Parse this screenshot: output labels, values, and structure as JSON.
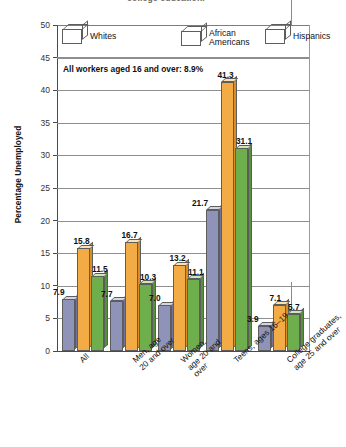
{
  "title": "college education.",
  "annotation": "All workers aged 16 and over: 8.9%",
  "y_axis_title": "Percentage Unemployed",
  "legend": [
    {
      "label": "Whites",
      "color": "#8f93b8",
      "key": "whites"
    },
    {
      "label": "African\nAmericans",
      "color": "#f2ab45",
      "key": "african-americans"
    },
    {
      "label": "Hispanics",
      "color": "#6fae4c",
      "key": "hispanics"
    }
  ],
  "y_ticks": [
    "0",
    "5",
    "10",
    "15",
    "20",
    "25",
    "30",
    "35",
    "40",
    "45",
    "50"
  ],
  "categories": [
    "All",
    "Men, age\n20 and over",
    "Women,\nage 20 and\nover",
    "Teens, ages 16–19",
    "College graduates,\nage 25 and over"
  ],
  "chart_data": {
    "type": "bar",
    "title": "college education.",
    "xlabel": "",
    "ylabel": "Percentage Unemployed",
    "ylim": [
      0,
      50
    ],
    "ytick_step": 5,
    "grid": true,
    "legend_position": "top-inside",
    "annotation": "All workers aged 16 and over: 8.9%",
    "categories": [
      "All",
      "Men, age 20 and over",
      "Women, age 20 and over",
      "Teens, ages 16–19",
      "College graduates, age 25 and over"
    ],
    "series": [
      {
        "name": "Whites",
        "color": "#8f93b8",
        "values": [
          7.9,
          7.7,
          7.0,
          21.7,
          3.9
        ]
      },
      {
        "name": "African Americans",
        "color": "#f2ab45",
        "values": [
          15.8,
          16.7,
          13.2,
          41.3,
          7.1
        ]
      },
      {
        "name": "Hispanics",
        "color": "#6fae4c",
        "values": [
          11.5,
          10.3,
          11.1,
          31.1,
          5.7
        ]
      }
    ]
  }
}
